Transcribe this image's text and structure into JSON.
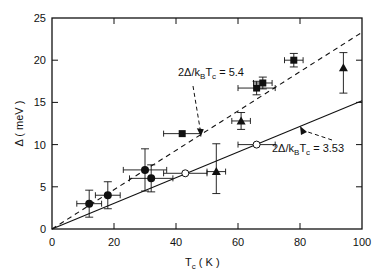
{
  "chart_data": {
    "type": "scatter",
    "title": "",
    "xlabel": "T_c ( K )",
    "ylabel": "Δ ( meV )",
    "xlim": [
      0,
      100
    ],
    "ylim": [
      0,
      25
    ],
    "xticks": [
      0,
      20,
      40,
      60,
      80,
      100
    ],
    "yticks": [
      0,
      5,
      10,
      15,
      20,
      25
    ],
    "xtick_labels": [
      "0",
      "20",
      "40",
      "60",
      "80",
      "100"
    ],
    "ytick_labels": [
      "0",
      "5",
      "10",
      "15",
      "20",
      "25"
    ],
    "grid": false,
    "series": [
      {
        "name": "filled-circles",
        "marker": "circle-filled",
        "points": [
          {
            "x": 12,
            "y": 3.0,
            "xerr": 4,
            "yerr": [
              1.6,
              1.6
            ]
          },
          {
            "x": 18,
            "y": 4.0,
            "xerr": 4,
            "yerr": [
              1.6,
              1.6
            ]
          },
          {
            "x": 30,
            "y": 7.0,
            "xerr": 7,
            "yerr": [
              2.5,
              2.5
            ]
          },
          {
            "x": 32,
            "y": 6.0,
            "xerr": 7,
            "yerr": [
              1.6,
              1.6
            ]
          }
        ]
      },
      {
        "name": "open-circles",
        "marker": "circle-open",
        "points": [
          {
            "x": 43,
            "y": 6.6,
            "xerr": 7,
            "yerr": [
              0,
              0
            ]
          },
          {
            "x": 66,
            "y": 10.0,
            "xerr": 6,
            "yerr": [
              0,
              0
            ]
          }
        ]
      },
      {
        "name": "filled-squares",
        "marker": "square-filled",
        "points": [
          {
            "x": 42,
            "y": 11.3,
            "xerr": 6,
            "yerr": [
              0,
              0
            ]
          },
          {
            "x": 66,
            "y": 16.7,
            "xerr": 6,
            "yerr": [
              0.8,
              0.8
            ]
          },
          {
            "x": 68,
            "y": 17.3,
            "xerr": 3,
            "yerr": [
              0.7,
              0.7
            ]
          },
          {
            "x": 78,
            "y": 20.0,
            "xerr": 3,
            "yerr": [
              0.8,
              0.8
            ]
          }
        ]
      },
      {
        "name": "filled-triangles",
        "marker": "triangle-filled",
        "points": [
          {
            "x": 53,
            "y": 6.8,
            "xerr": 3,
            "yerr": [
              2.6,
              3.3
            ]
          },
          {
            "x": 61,
            "y": 12.8,
            "xerr": 3,
            "yerr": [
              1.0,
              1.0
            ]
          },
          {
            "x": 94,
            "y": 19.1,
            "xerr": 0,
            "yerr": [
              3.0,
              1.8
            ]
          }
        ]
      }
    ],
    "lines": [
      {
        "name": "bcs-weak-coupling",
        "style": "solid",
        "ratio": 3.53,
        "x": [
          0,
          100
        ],
        "y": [
          0,
          15.2
        ]
      },
      {
        "name": "strong-coupling",
        "style": "dashed",
        "ratio": 5.4,
        "x": [
          0,
          100
        ],
        "y": [
          0,
          23.3
        ]
      }
    ],
    "annotations": [
      {
        "text": "2Δ/k_BT_c = 5.4",
        "main": "2Δ/k",
        "sub1": "B",
        "mid": "T",
        "sub2": "c",
        "tail": " = 5.4",
        "points_to": {
          "x": 48,
          "y": 11.0
        }
      },
      {
        "text": "2Δ/k_BT_c = 3.53",
        "main": "2Δ/k",
        "sub1": "B",
        "mid": "T",
        "sub2": "c",
        "tail": " = 3.53",
        "points_to": {
          "x": 80,
          "y": 12.2
        }
      }
    ],
    "axis_label_parts": {
      "x_main": "T",
      "x_sub": "c",
      "x_unit": " ( K )",
      "y_text": "Δ ( meV )"
    }
  }
}
